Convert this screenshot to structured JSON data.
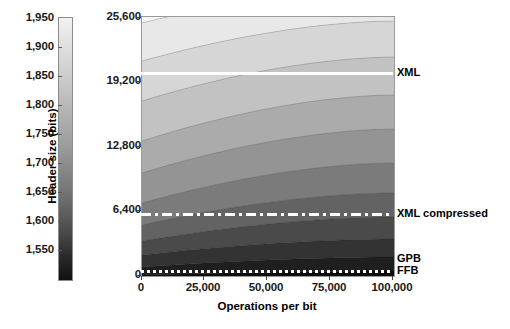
{
  "chart_data": {
    "type": "heatmap",
    "title": "",
    "xlabel": "Operations per bit",
    "ylabel": "Header size (bits)",
    "xlim": [
      0,
      100000
    ],
    "ylim": [
      0,
      25600
    ],
    "xticks": [
      "0",
      "25,000",
      "50,000",
      "75,000",
      "100,000"
    ],
    "xtick_values": [
      0,
      25000,
      50000,
      75000,
      100000
    ],
    "yticks": [
      "0",
      "6,400",
      "12,800",
      "19,200",
      "25,600"
    ],
    "ytick_values": [
      0,
      6400,
      12800,
      19200,
      25600
    ],
    "grid": false,
    "legend_position": "right-annotations",
    "colorbar": {
      "ticks": [
        "1,950",
        "1,900",
        "1,850",
        "1,800",
        "1,750",
        "1,700",
        "1,650",
        "1,600",
        "1,550"
      ],
      "tick_values": [
        1950,
        1900,
        1850,
        1800,
        1750,
        1700,
        1650,
        1600,
        1550
      ],
      "vmin": 1540,
      "vmax": 1960,
      "orientation": "vertical",
      "colormap": "grayscale"
    },
    "contour_levels": [
      1550,
      1600,
      1650,
      1700,
      1750,
      1800,
      1850,
      1900,
      1950
    ],
    "band_fill_colors": [
      "#0d0d0d",
      "#1f1f1f",
      "#333333",
      "#4a4a4a",
      "#636363",
      "#7b7b7b",
      "#949494",
      "#ababab",
      "#c2c2c2",
      "#d6d6d6",
      "#e8e8e8",
      "#f5f5f5"
    ],
    "reference_lines": [
      {
        "name": "XML",
        "label": "XML",
        "y_value": 19800,
        "style": "dashed",
        "color": "#ffffff"
      },
      {
        "name": "XML compressed",
        "label": "XML compressed",
        "y_value": 5600,
        "style": "dash-dot",
        "color": "#ffffff"
      },
      {
        "name": "GPB",
        "label": "GPB",
        "y_value": 1000,
        "style": "solid-region",
        "color": "#ffffff"
      },
      {
        "name": "FFB",
        "label": "FFB",
        "y_value": 300,
        "style": "dotted",
        "color": "#ffffff"
      }
    ]
  },
  "colorbar": {
    "labels": [
      {
        "text": "1,950",
        "top": 11
      },
      {
        "text": "1,900",
        "top": 40
      },
      {
        "text": "1,850",
        "top": 69
      },
      {
        "text": "1,800",
        "top": 98
      },
      {
        "text": "1,750",
        "top": 127
      },
      {
        "text": "1,700",
        "top": 156
      },
      {
        "text": "1,650",
        "top": 185
      },
      {
        "text": "1,600",
        "top": 214
      },
      {
        "text": "1,550",
        "top": 243
      }
    ]
  },
  "axes": {
    "ylabel": "Header size (bits)",
    "xlabel": "Operations per bit",
    "ylabels": [
      {
        "text": "25,600",
        "top": 10
      },
      {
        "text": "19,200",
        "top": 74
      },
      {
        "text": "12,800",
        "top": 139
      },
      {
        "text": "6,400",
        "top": 203
      },
      {
        "text": "0",
        "top": 268
      }
    ],
    "xlabels": [
      {
        "text": "0",
        "left": 106
      },
      {
        "text": "25,000",
        "left": 168
      },
      {
        "text": "50,000",
        "left": 231
      },
      {
        "text": "75,000",
        "left": 294
      },
      {
        "text": "100,000",
        "left": 357
      }
    ]
  },
  "annotations": [
    {
      "name": "xml",
      "text": "XML",
      "top": 66
    },
    {
      "name": "xml-compressed",
      "text": "XML compressed",
      "top": 207
    },
    {
      "name": "gpb",
      "text": "GPB",
      "top": 252
    },
    {
      "name": "ffb",
      "text": "FFB",
      "top": 264
    }
  ]
}
